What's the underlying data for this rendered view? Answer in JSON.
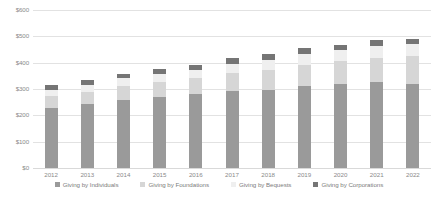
{
  "chart_data": {
    "type": "bar",
    "stacked": true,
    "title": "",
    "subtitle": "",
    "xlabel": "",
    "ylabel": "",
    "categories": [
      "2012",
      "2013",
      "2014",
      "2015",
      "2016",
      "2017",
      "2018",
      "2019",
      "2020",
      "2021",
      "2022"
    ],
    "ylim": [
      0,
      600
    ],
    "ytick_values": [
      0,
      100,
      200,
      300,
      400,
      500,
      600
    ],
    "ytick_labels": [
      "$0",
      "$100",
      "$200",
      "$300",
      "$400",
      "$500",
      "$600"
    ],
    "grid": true,
    "legend_position": "bottom",
    "series": [
      {
        "name": "Giving by Individuals",
        "color": "#9a9a9a",
        "values": [
          228,
          242,
          258,
          268,
          282,
          293,
          296,
          310,
          318,
          327,
          319
        ]
      },
      {
        "name": "Giving by Foundations",
        "color": "#d6d6d6",
        "values": [
          45,
          48,
          54,
          58,
          60,
          66,
          76,
          80,
          89,
          91,
          105
        ]
      },
      {
        "name": "Giving by Bequests",
        "color": "#efefef",
        "values": [
          24,
          27,
          28,
          31,
          31,
          36,
          39,
          43,
          42,
          46,
          46
        ]
      },
      {
        "name": "Giving by Corporations",
        "color": "#757575",
        "values": [
          19,
          18,
          18,
          19,
          20,
          21,
          22,
          22,
          20,
          21,
          21
        ]
      }
    ]
  },
  "legend": {
    "items": [
      {
        "label": "Giving by Individuals",
        "color": "#9a9a9a"
      },
      {
        "label": "Giving by Foundations",
        "color": "#d6d6d6"
      },
      {
        "label": "Giving by Bequests",
        "color": "#efefef"
      },
      {
        "label": "Giving by Corporations",
        "color": "#757575"
      }
    ]
  },
  "axes": {
    "y_labels": [
      "$600",
      "$500",
      "$400",
      "$300",
      "$200",
      "$100",
      "$0"
    ],
    "x_labels": [
      "2012",
      "2013",
      "2014",
      "2015",
      "2016",
      "2017",
      "2018",
      "2019",
      "2020",
      "2021",
      "2022"
    ]
  },
  "colors": {
    "gridline": "#e2e2e2",
    "tick_text": "#8a8a8a",
    "legend_text": "#7d7d7d",
    "background": "#ffffff"
  }
}
